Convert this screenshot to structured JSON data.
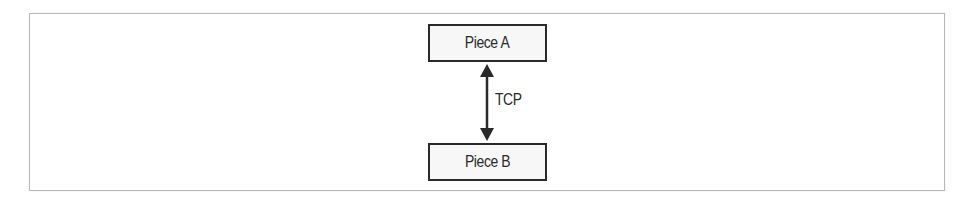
{
  "diagram": {
    "type": "block-diagram",
    "nodes": [
      {
        "id": "a",
        "label": "Piece A"
      },
      {
        "id": "b",
        "label": "Piece B"
      }
    ],
    "edges": [
      {
        "from": "a",
        "to": "b",
        "label": "TCP",
        "direction": "bidirectional"
      }
    ],
    "colors": {
      "stroke": "#2a2a2a",
      "frame": "#b8b8b8",
      "node_fill": "#f7f7f7",
      "background": "#ffffff"
    }
  }
}
